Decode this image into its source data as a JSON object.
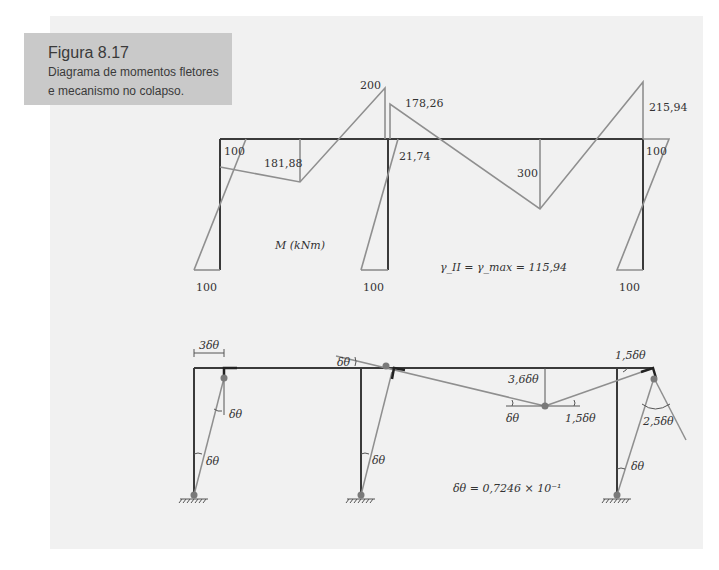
{
  "figure": {
    "number": "Figura 8.17",
    "caption": "Diagrama de momentos fletores e mecanismo no colapso.",
    "caption_lines": [
      "Diagrama de momentos fletores",
      "e mecanismo no colapso."
    ]
  },
  "moment_diagram": {
    "unit_label": "M (kNm)",
    "values": {
      "left_knee": "100",
      "left_span_mid": "181,88",
      "peak_over_mid_column": "200",
      "right_of_mid_column_top": "178,26",
      "mid_column_top": "21,74",
      "right_span_mid": "300",
      "right_knee_peak": "215,94",
      "right_knee": "100",
      "base_left": "100",
      "base_middle": "100",
      "base_right": "100"
    },
    "load_factor": "γ_II = γ_max = 115,94"
  },
  "mechanism": {
    "sway_label": "3δθ",
    "angles": {
      "left_column_top": "δθ",
      "left_column_base": "δθ",
      "middle_top": "δθ",
      "middle_column_base": "δθ",
      "beam_hinge_vertical": "3,6δθ",
      "beam_hinge_left": "δθ",
      "beam_hinge_right": "1,5δθ",
      "right_knee_top": "1,5δθ",
      "right_knee_rotation": "2,5δθ",
      "right_column_base": "δθ"
    },
    "delta_theta_value": "δθ = 0,7246 × 10⁻¹"
  },
  "colors": {
    "frame": "#3a3a3a",
    "diagram": "#8f8f8f",
    "hinge": "#7a7a7a",
    "panel": "#f1f1f1",
    "caption_box": "#c9c9c9"
  }
}
